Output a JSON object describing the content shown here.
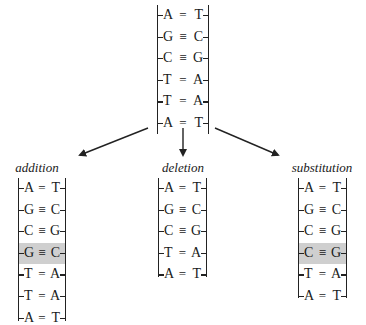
{
  "diagram": {
    "type": "DNA mutation types",
    "original": {
      "pairs": [
        {
          "left": "A",
          "bond": "=",
          "right": "T"
        },
        {
          "left": "G",
          "bond": "≡",
          "right": "C"
        },
        {
          "left": "C",
          "bond": "≡",
          "right": "G"
        },
        {
          "left": "T",
          "bond": "=",
          "right": "A"
        },
        {
          "left": "T",
          "bond": "=",
          "right": "A"
        },
        {
          "left": "A",
          "bond": "=",
          "right": "T"
        }
      ]
    },
    "mutations": [
      {
        "label": "addition",
        "pairs": [
          {
            "left": "A",
            "bond": "=",
            "right": "T"
          },
          {
            "left": "G",
            "bond": "≡",
            "right": "C"
          },
          {
            "left": "C",
            "bond": "≡",
            "right": "G"
          },
          {
            "left": "G",
            "bond": "≡",
            "right": "C",
            "highlighted": true
          },
          {
            "left": "T",
            "bond": "=",
            "right": "A"
          },
          {
            "left": "T",
            "bond": "=",
            "right": "A"
          },
          {
            "left": "A",
            "bond": "=",
            "right": "T"
          }
        ]
      },
      {
        "label": "deletion",
        "pairs": [
          {
            "left": "A",
            "bond": "=",
            "right": "T"
          },
          {
            "left": "G",
            "bond": "≡",
            "right": "C"
          },
          {
            "left": "C",
            "bond": "≡",
            "right": "G"
          },
          {
            "left": "T",
            "bond": "=",
            "right": "A"
          },
          {
            "left": "A",
            "bond": "=",
            "right": "T"
          }
        ]
      },
      {
        "label": "substitution",
        "pairs": [
          {
            "left": "A",
            "bond": "=",
            "right": "T"
          },
          {
            "left": "G",
            "bond": "≡",
            "right": "C"
          },
          {
            "left": "C",
            "bond": "≡",
            "right": "G"
          },
          {
            "left": "C",
            "bond": "≡",
            "right": "G",
            "highlighted": true
          },
          {
            "left": "T",
            "bond": "=",
            "right": "A"
          },
          {
            "left": "A",
            "bond": "=",
            "right": "T"
          }
        ]
      }
    ],
    "colors": {
      "line": "#222222",
      "highlight": "#cfcfcf",
      "background": "#ffffff"
    }
  }
}
